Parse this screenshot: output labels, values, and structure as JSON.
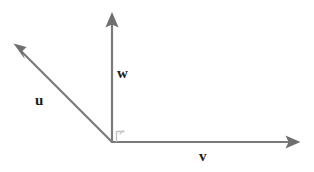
{
  "figure": {
    "background_color": "#ffffff",
    "width": 314,
    "height": 172,
    "stroke_color": "#7a7a7a",
    "label_color": "#1c1c1c",
    "angle_marker_color": "#b9b9b9",
    "origin": {
      "x": 112,
      "y": 142
    }
  },
  "vectors": [
    {
      "name": "u",
      "label": "u",
      "icon": "arrow-up-left-icon",
      "from": {
        "x": 112,
        "y": 142
      },
      "to": {
        "x": 14,
        "y": 44
      },
      "label_position": {
        "x": 35,
        "y": 93
      },
      "color": "#7a7a7a"
    },
    {
      "name": "w",
      "label": "w",
      "icon": "arrow-up-icon",
      "from": {
        "x": 112,
        "y": 142
      },
      "to": {
        "x": 112,
        "y": 12
      },
      "label_position": {
        "x": 117,
        "y": 66
      },
      "color": "#7a7a7a"
    },
    {
      "name": "v",
      "label": "v",
      "icon": "arrow-right-icon",
      "from": {
        "x": 112,
        "y": 142
      },
      "to": {
        "x": 300,
        "y": 142
      },
      "label_position": {
        "x": 199,
        "y": 149
      },
      "color": "#7a7a7a"
    }
  ],
  "annotations": [
    {
      "name": "right-angle-marker",
      "icon": "right-angle-icon",
      "at": {
        "x": 112,
        "y": 142
      },
      "between": [
        "w",
        "v"
      ],
      "color": "#b9b9b9"
    }
  ]
}
